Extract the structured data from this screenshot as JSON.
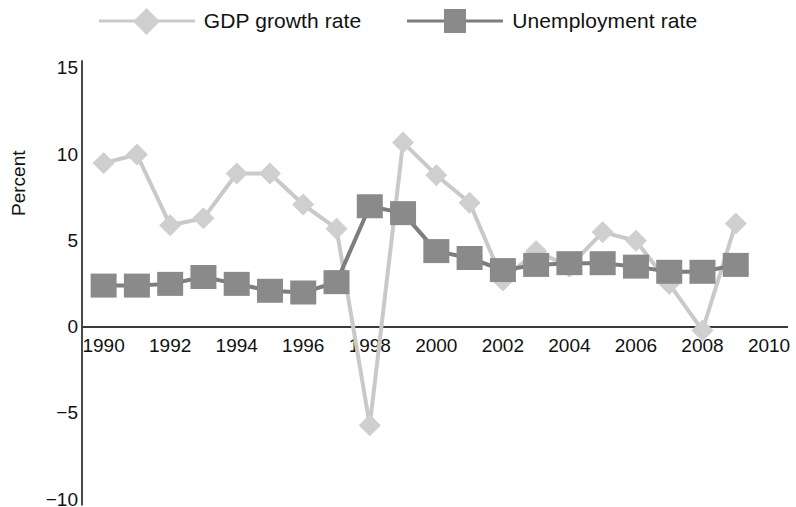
{
  "legend": {
    "entries": [
      {
        "label": "GDP growth rate",
        "marker": "diamond",
        "color": "#cfcfcf"
      },
      {
        "label": "Unemployment rate",
        "marker": "square",
        "color": "#8a8a8a"
      }
    ]
  },
  "axes": {
    "y_title": "Percent",
    "y_ticks": [
      "15",
      "10",
      "5",
      "0",
      "-5",
      "-10"
    ],
    "x_ticks": [
      "1990",
      "1992",
      "1994",
      "1996",
      "1998",
      "2000",
      "2002",
      "2004",
      "2006",
      "2008",
      "2010"
    ]
  },
  "chart_data": {
    "type": "line",
    "title": "",
    "xlabel": "",
    "ylabel": "Percent",
    "xlim": [
      1989.3,
      2010.4
    ],
    "ylim": [
      -10,
      15
    ],
    "y_ticks": [
      15,
      10,
      5,
      0,
      -5,
      -10
    ],
    "x_ticks": [
      1990,
      1992,
      1994,
      1996,
      1998,
      2000,
      2002,
      2004,
      2006,
      2008,
      2010
    ],
    "grid": false,
    "legend_position": "top-center",
    "x": [
      1990,
      1991,
      1992,
      1993,
      1994,
      1995,
      1996,
      1997,
      1998,
      1999,
      2000,
      2001,
      2002,
      2003,
      2004,
      2005,
      2006,
      2007,
      2008,
      2009
    ],
    "series": [
      {
        "name": "GDP growth rate",
        "marker": "diamond",
        "color": "#cfcfcf",
        "line_color": "#c9c9c9",
        "values": [
          9.5,
          10.0,
          5.9,
          6.3,
          8.9,
          8.9,
          7.1,
          5.7,
          -5.7,
          10.7,
          8.8,
          7.2,
          2.7,
          4.4,
          3.5,
          5.5,
          5.0,
          2.5,
          -0.2,
          6.0
        ]
      },
      {
        "name": "Unemployment rate",
        "marker": "square",
        "color": "#8a8a8a",
        "line_color": "#7d7d7d",
        "values": [
          2.4,
          2.4,
          2.5,
          2.9,
          2.5,
          2.1,
          2.0,
          2.6,
          7.0,
          6.6,
          4.4,
          4.0,
          3.3,
          3.6,
          3.7,
          3.7,
          3.5,
          3.2,
          3.2,
          3.6
        ]
      }
    ]
  },
  "geometry": {
    "plot_left": 82,
    "plot_right": 784,
    "y_zero_px": 327,
    "px_per_unit": 17.25,
    "x_left_year": 1989.35,
    "x_right_year": 2010.45
  }
}
